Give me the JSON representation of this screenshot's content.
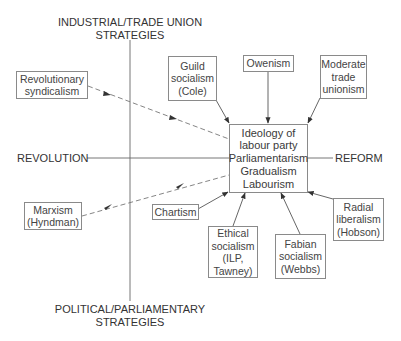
{
  "axes": {
    "top_label": [
      "INDUSTRIAL/TRADE UNION",
      "STRATEGIES"
    ],
    "bottom_label": [
      "POLITICAL/PARLIAMENTARY",
      "STRATEGIES"
    ],
    "left_label": "REVOLUTION",
    "right_label": "REFORM"
  },
  "central": {
    "lines": [
      "Ideology of",
      "labour party",
      "Parliamentarism",
      "Gradualism",
      "Labourism"
    ]
  },
  "influences": {
    "revolutionary_syndicalism": {
      "lines": [
        "Revolutionary",
        "syndicalism"
      ],
      "link": "dashed"
    },
    "guild_socialism": {
      "lines": [
        "Guild",
        "socialism",
        "(Cole)"
      ],
      "link": "solid"
    },
    "owenism": {
      "lines": [
        "Owenism"
      ],
      "link": "solid"
    },
    "moderate_trade_unionism": {
      "lines": [
        "Moderate",
        "trade",
        "unionism"
      ],
      "link": "solid"
    },
    "marxism": {
      "lines": [
        "Marxism",
        "(Hyndman)"
      ],
      "link": "dashed"
    },
    "chartism": {
      "lines": [
        "Chartism"
      ],
      "link": "solid"
    },
    "ethical_socialism": {
      "lines": [
        "Ethical",
        "socialism",
        "(ILP,",
        "Tawney)"
      ],
      "link": "solid"
    },
    "fabian_socialism": {
      "lines": [
        "Fabian",
        "socialism",
        "(Webbs)"
      ],
      "link": "solid"
    },
    "radial_liberalism": {
      "lines": [
        "Radial",
        "liberalism",
        "(Hobson)"
      ],
      "link": "solid"
    }
  },
  "caption": {
    "text": ""
  },
  "colors": {
    "line": "#555555",
    "box_border": "#8a8a8a",
    "text": "#3a3a3a",
    "background": "#ffffff"
  }
}
